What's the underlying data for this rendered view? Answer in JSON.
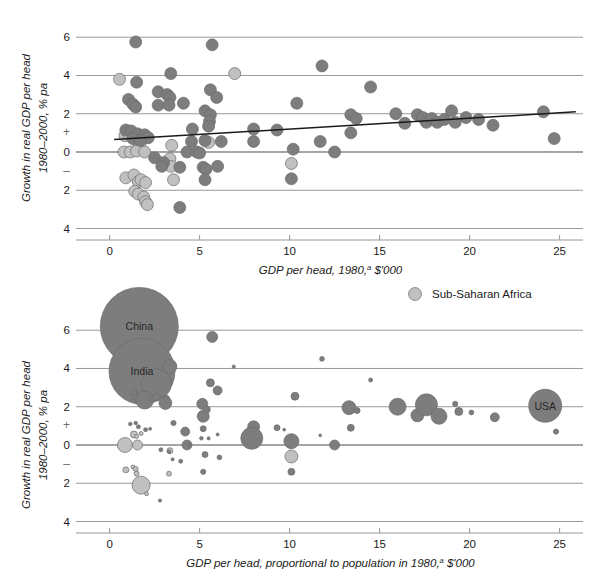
{
  "colors": {
    "other": "#7d7d7d",
    "ssa": "#c0c0c0",
    "dot_stroke": "#6b6b6b",
    "grid": "#8c8c8c",
    "zero": "#4d4d4d",
    "trend": "#1a1a1a",
    "text": "#1a1a1a",
    "background": "#ffffff"
  },
  "legend": {
    "position": "top-right-of-lower-panel",
    "items": [
      {
        "label": "Sub-Saharan Africa",
        "color": "#c0c0c0",
        "marker": "circle"
      }
    ]
  },
  "axis": {
    "y_title_line1": "Growth in real GDP per head",
    "y_title_line2": "1980–2000, % pa",
    "y_ticks": [
      "6",
      "4",
      "2",
      "0",
      "2",
      "4"
    ],
    "y_tick_values": [
      6,
      4,
      2,
      0,
      -2,
      -4
    ],
    "y_sign_plus": "+",
    "y_sign_minus": "–",
    "x_ticks": [
      "0",
      "5",
      "10",
      "15",
      "20",
      "25"
    ],
    "x_tick_values": [
      0,
      5,
      10,
      15,
      20,
      25
    ],
    "xlim": [
      -1.2,
      26.3
    ],
    "ylim": [
      -4.6,
      6.9
    ],
    "grid": true
  },
  "chart_data": [
    {
      "id": "top",
      "type": "scatter",
      "title": "",
      "xlabel": "GDP per head, 1980,ᵃ $'000",
      "xlabel_main": "GDP per head, 1980,",
      "xlabel_sup": "a",
      "xlabel_tail": " $'000",
      "ylabel": "Growth in real GDP per head 1980–2000, % pa",
      "xlim": [
        -1.2,
        26.3
      ],
      "ylim": [
        -4.6,
        6.9
      ],
      "xticks": [
        0,
        5,
        10,
        15,
        20,
        25
      ],
      "yticks": [
        6,
        4,
        2,
        0,
        -2,
        -4
      ],
      "marker_radius": 6.0,
      "trendline": {
        "x0": 0.25,
        "y0": 0.65,
        "x1": 25.9,
        "y1": 2.1
      },
      "series": [
        {
          "name": "Sub-Saharan Africa",
          "color": "#c0c0c0",
          "points": [
            [
              0.55,
              3.8
            ],
            [
              0.85,
              0.85
            ],
            [
              1.05,
              0.95
            ],
            [
              1.3,
              0.75
            ],
            [
              1.5,
              0.6
            ],
            [
              1.75,
              0.55
            ],
            [
              0.8,
              0.0
            ],
            [
              1.15,
              0.0
            ],
            [
              1.5,
              0.05
            ],
            [
              1.95,
              0.0
            ],
            [
              0.9,
              -1.35
            ],
            [
              1.35,
              -1.2
            ],
            [
              1.6,
              -1.55
            ],
            [
              1.75,
              -1.45
            ],
            [
              2.0,
              -1.6
            ],
            [
              1.4,
              -2.05
            ],
            [
              1.6,
              -2.2
            ],
            [
              1.9,
              -2.35
            ],
            [
              2.0,
              -2.6
            ],
            [
              2.1,
              -2.75
            ],
            [
              3.35,
              -0.35
            ],
            [
              3.4,
              -0.75
            ],
            [
              3.45,
              0.35
            ],
            [
              3.55,
              -1.45
            ],
            [
              5.5,
              0.5
            ],
            [
              6.95,
              4.1
            ],
            [
              10.1,
              -0.6
            ]
          ]
        },
        {
          "name": "Other countries",
          "color": "#7d7d7d",
          "points": [
            [
              1.45,
              5.75
            ],
            [
              5.7,
              5.6
            ],
            [
              3.4,
              4.1
            ],
            [
              11.8,
              4.5
            ],
            [
              1.5,
              3.65
            ],
            [
              2.7,
              3.15
            ],
            [
              3.2,
              3.0
            ],
            [
              3.35,
              2.85
            ],
            [
              5.6,
              3.25
            ],
            [
              5.95,
              2.85
            ],
            [
              14.5,
              3.4
            ],
            [
              1.05,
              2.75
            ],
            [
              1.3,
              2.5
            ],
            [
              1.45,
              2.35
            ],
            [
              2.7,
              2.45
            ],
            [
              3.3,
              2.45
            ],
            [
              4.1,
              2.55
            ],
            [
              10.4,
              2.55
            ],
            [
              5.3,
              2.15
            ],
            [
              5.6,
              1.95
            ],
            [
              5.55,
              1.6
            ],
            [
              5.5,
              1.35
            ],
            [
              13.4,
              1.95
            ],
            [
              13.7,
              1.75
            ],
            [
              15.9,
              2.0
            ],
            [
              16.4,
              1.5
            ],
            [
              17.1,
              1.95
            ],
            [
              17.4,
              1.8
            ],
            [
              17.6,
              1.55
            ],
            [
              17.9,
              1.75
            ],
            [
              18.2,
              1.55
            ],
            [
              18.6,
              1.7
            ],
            [
              19.0,
              2.15
            ],
            [
              19.2,
              1.55
            ],
            [
              19.8,
              1.8
            ],
            [
              20.5,
              1.7
            ],
            [
              21.3,
              1.4
            ],
            [
              24.1,
              2.1
            ],
            [
              0.9,
              1.15
            ],
            [
              1.2,
              1.1
            ],
            [
              1.55,
              0.95
            ],
            [
              1.95,
              0.9
            ],
            [
              2.15,
              0.75
            ],
            [
              1.3,
              0.7
            ],
            [
              1.7,
              0.6
            ],
            [
              4.6,
              1.2
            ],
            [
              8.0,
              1.2
            ],
            [
              9.3,
              1.15
            ],
            [
              13.4,
              1.0
            ],
            [
              4.55,
              0.55
            ],
            [
              5.3,
              0.6
            ],
            [
              6.2,
              0.55
            ],
            [
              8.0,
              0.55
            ],
            [
              11.7,
              0.55
            ],
            [
              24.7,
              0.7
            ],
            [
              2.5,
              -0.3
            ],
            [
              3.0,
              -0.55
            ],
            [
              4.3,
              0.0
            ],
            [
              4.85,
              0.0
            ],
            [
              5.0,
              -0.05
            ],
            [
              10.2,
              0.15
            ],
            [
              12.5,
              0.0
            ],
            [
              2.9,
              -0.75
            ],
            [
              3.9,
              -0.8
            ],
            [
              5.2,
              -0.8
            ],
            [
              5.35,
              -0.9
            ],
            [
              6.0,
              -0.75
            ],
            [
              5.3,
              -1.45
            ],
            [
              10.1,
              -1.4
            ],
            [
              3.9,
              -2.9
            ]
          ]
        }
      ]
    },
    {
      "id": "bottom",
      "type": "bubble",
      "title": "",
      "xlabel": "GDP per head, proportional to population in 1980,ᵃ $'000",
      "xlabel_main": "GDP per head, proportional to population in 1980,",
      "xlabel_sup": "a",
      "xlabel_tail": " $'000",
      "ylabel": "Growth in real GDP per head 1980–2000, % pa",
      "xlim": [
        -1.2,
        26.3
      ],
      "ylim": [
        -4.6,
        6.9
      ],
      "xticks": [
        0,
        5,
        10,
        15,
        20,
        25
      ],
      "yticks": [
        6,
        4,
        2,
        0,
        -2,
        -4
      ],
      "size_meaning": "bubble area proportional to population in 1980",
      "annotations": [
        {
          "label": "China",
          "x": 1.65,
          "y": 6.2
        },
        {
          "label": "India",
          "x": 1.8,
          "y": 3.85
        },
        {
          "label": "USA",
          "x": 24.2,
          "y": 2.05
        }
      ],
      "series": [
        {
          "name": "Sub-Saharan Africa",
          "color": "#c0c0c0",
          "points": [
            {
              "x": 0.55,
              "y": 3.8,
              "r": 2.5
            },
            {
              "x": 0.85,
              "y": 0.0,
              "r": 7.5
            },
            {
              "x": 1.55,
              "y": 0.0,
              "r": 5.0
            },
            {
              "x": 1.35,
              "y": 0.55,
              "r": 3.5
            },
            {
              "x": 1.5,
              "y": 0.45,
              "r": 2.0
            },
            {
              "x": 1.75,
              "y": 0.6,
              "r": 2.0
            },
            {
              "x": 0.9,
              "y": -1.3,
              "r": 3.0
            },
            {
              "x": 1.3,
              "y": -1.15,
              "r": 2.0
            },
            {
              "x": 1.45,
              "y": -1.25,
              "r": 2.5
            },
            {
              "x": 1.5,
              "y": -1.5,
              "r": 2.5
            },
            {
              "x": 1.75,
              "y": -2.1,
              "r": 9.0
            },
            {
              "x": 2.05,
              "y": -2.55,
              "r": 2.0
            },
            {
              "x": 3.35,
              "y": -0.3,
              "r": 3.0
            },
            {
              "x": 3.3,
              "y": -1.5,
              "r": 2.5
            },
            {
              "x": 10.1,
              "y": -0.6,
              "r": 6.5
            }
          ]
        },
        {
          "name": "Other countries",
          "color": "#7d7d7d",
          "points": [
            {
              "x": 1.65,
              "y": 6.2,
              "r": 39.0
            },
            {
              "x": 1.8,
              "y": 3.85,
              "r": 33.0
            },
            {
              "x": 5.7,
              "y": 5.65,
              "r": 5.5
            },
            {
              "x": 3.35,
              "y": 4.1,
              "r": 7.0
            },
            {
              "x": 2.6,
              "y": 3.2,
              "r": 15.0
            },
            {
              "x": 6.9,
              "y": 4.1,
              "r": 1.6
            },
            {
              "x": 11.8,
              "y": 4.5,
              "r": 2.4
            },
            {
              "x": 14.5,
              "y": 3.4,
              "r": 2.0
            },
            {
              "x": 1.5,
              "y": 2.5,
              "r": 4.0
            },
            {
              "x": 1.95,
              "y": 2.35,
              "r": 9.0
            },
            {
              "x": 2.6,
              "y": 2.5,
              "r": 4.0
            },
            {
              "x": 3.15,
              "y": 2.45,
              "r": 3.0
            },
            {
              "x": 5.6,
              "y": 3.25,
              "r": 4.0
            },
            {
              "x": 6.0,
              "y": 2.85,
              "r": 4.5
            },
            {
              "x": 10.3,
              "y": 2.55,
              "r": 4.0
            },
            {
              "x": 5.15,
              "y": 2.15,
              "r": 5.5
            },
            {
              "x": 5.4,
              "y": 1.85,
              "r": 3.5
            },
            {
              "x": 5.2,
              "y": 1.5,
              "r": 6.0
            },
            {
              "x": 13.3,
              "y": 1.95,
              "r": 7.0
            },
            {
              "x": 13.75,
              "y": 1.8,
              "r": 3.0
            },
            {
              "x": 16.0,
              "y": 2.0,
              "r": 8.5
            },
            {
              "x": 17.1,
              "y": 1.55,
              "r": 6.5
            },
            {
              "x": 17.6,
              "y": 2.1,
              "r": 11.0
            },
            {
              "x": 18.3,
              "y": 1.5,
              "r": 8.0
            },
            {
              "x": 19.2,
              "y": 2.15,
              "r": 2.6
            },
            {
              "x": 19.4,
              "y": 1.75,
              "r": 4.0
            },
            {
              "x": 20.1,
              "y": 1.7,
              "r": 2.4
            },
            {
              "x": 21.4,
              "y": 1.45,
              "r": 4.5
            },
            {
              "x": 24.2,
              "y": 2.05,
              "r": 16.5
            },
            {
              "x": 24.8,
              "y": 0.7,
              "r": 2.6
            },
            {
              "x": 1.15,
              "y": 1.1,
              "r": 1.8
            },
            {
              "x": 1.45,
              "y": 1.15,
              "r": 1.8
            },
            {
              "x": 1.6,
              "y": 0.95,
              "r": 2.0
            },
            {
              "x": 2.0,
              "y": 0.8,
              "r": 2.0
            },
            {
              "x": 2.25,
              "y": 0.85,
              "r": 1.5
            },
            {
              "x": 3.55,
              "y": 1.15,
              "r": 2.6
            },
            {
              "x": 4.2,
              "y": 0.7,
              "r": 4.5
            },
            {
              "x": 5.2,
              "y": 0.85,
              "r": 3.0
            },
            {
              "x": 5.1,
              "y": 0.35,
              "r": 1.8
            },
            {
              "x": 5.5,
              "y": 0.35,
              "r": 1.6
            },
            {
              "x": 6.0,
              "y": 0.55,
              "r": 1.5
            },
            {
              "x": 8.0,
              "y": 0.95,
              "r": 6.0
            },
            {
              "x": 7.9,
              "y": 0.35,
              "r": 11.0
            },
            {
              "x": 9.3,
              "y": 0.9,
              "r": 3.0
            },
            {
              "x": 9.7,
              "y": 0.8,
              "r": 1.4
            },
            {
              "x": 10.1,
              "y": 0.2,
              "r": 7.5
            },
            {
              "x": 11.7,
              "y": 0.5,
              "r": 1.4
            },
            {
              "x": 12.5,
              "y": 0.0,
              "r": 5.0
            },
            {
              "x": 13.4,
              "y": 0.9,
              "r": 3.5
            },
            {
              "x": 2.85,
              "y": -0.25,
              "r": 2.0
            },
            {
              "x": 3.3,
              "y": -0.35,
              "r": 1.8
            },
            {
              "x": 4.3,
              "y": 0.0,
              "r": 5.0
            },
            {
              "x": 4.45,
              "y": 0.0,
              "r": 1.6
            },
            {
              "x": 5.3,
              "y": -0.5,
              "r": 3.0
            },
            {
              "x": 6.1,
              "y": -0.65,
              "r": 2.4
            },
            {
              "x": 3.5,
              "y": -0.75,
              "r": 1.6
            },
            {
              "x": 3.95,
              "y": -0.85,
              "r": 2.0
            },
            {
              "x": 5.2,
              "y": -1.4,
              "r": 2.6
            },
            {
              "x": 10.1,
              "y": -1.4,
              "r": 3.5
            },
            {
              "x": 2.8,
              "y": -2.9,
              "r": 1.6
            },
            {
              "x": 2.35,
              "y": 2.4,
              "r": 2.4
            },
            {
              "x": 3.1,
              "y": 2.2,
              "r": 6.5
            },
            {
              "x": 1.35,
              "y": 2.75,
              "r": 3.0
            }
          ]
        }
      ]
    }
  ]
}
